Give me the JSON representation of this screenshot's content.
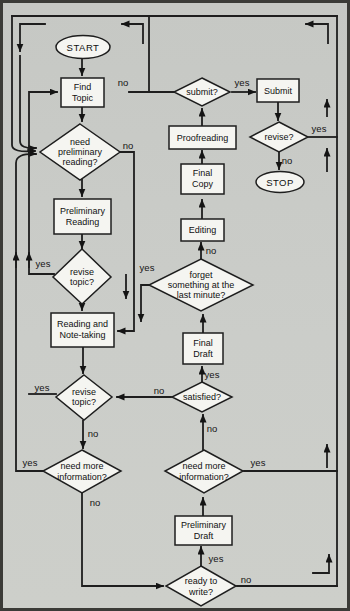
{
  "colors": {
    "background": "#c9cbc7",
    "node_fill": "#f5f5f1",
    "line": "#1e1e1e",
    "frame": "#3b3b37"
  },
  "labels": {
    "yes": "yes",
    "no": "no"
  },
  "nodes": {
    "start": {
      "label": "START"
    },
    "find_topic": {
      "line1": "Find",
      "line2": "Topic"
    },
    "need_prelim_reading": {
      "line1": "need",
      "line2": "preliminary",
      "line3": "reading?"
    },
    "preliminary_reading": {
      "line1": "Preliminary",
      "line2": "Reading"
    },
    "revise_topic_1": {
      "line1": "revise",
      "line2": "topic?"
    },
    "reading_note_taking": {
      "line1": "Reading and",
      "line2": "Note-taking"
    },
    "revise_topic_2": {
      "line1": "revise",
      "line2": "topic?"
    },
    "need_more_info_left": {
      "line1": "need more",
      "line2": "information?"
    },
    "submit_q": {
      "label": "submit?"
    },
    "submit": {
      "label": "Submit"
    },
    "revise_q": {
      "label": "revise?"
    },
    "stop": {
      "label": "STOP"
    },
    "proofreading": {
      "label": "Proofreading"
    },
    "final_copy": {
      "line1": "Final",
      "line2": "Copy"
    },
    "editing": {
      "label": "Editing"
    },
    "forget_something": {
      "line1": "forget",
      "line2": "something at the",
      "line3": "last minute?"
    },
    "final_draft": {
      "line1": "Final",
      "line2": "Draft"
    },
    "satisfied": {
      "label": "satisfied?"
    },
    "need_more_info_right": {
      "line1": "need more",
      "line2": "information?"
    },
    "preliminary_draft": {
      "line1": "Preliminary",
      "line2": "Draft"
    },
    "ready_to_write": {
      "line1": "ready to",
      "line2": "write?"
    }
  }
}
